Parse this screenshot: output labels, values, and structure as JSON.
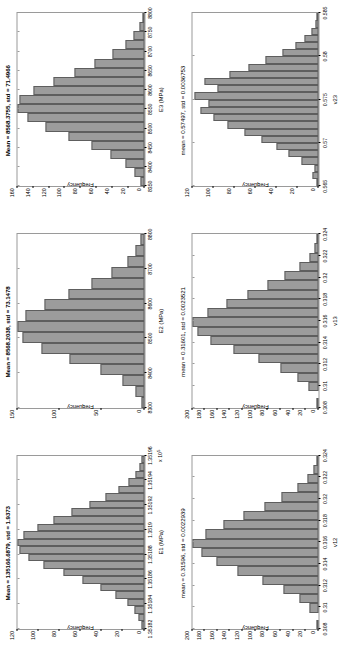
{
  "figure": {
    "bar_fill": "#9c9c9c",
    "bar_edge": "#5e5e5e",
    "axes_color": "#9a9a9a",
    "background": "#ffffff",
    "ylabel": "Frequency"
  },
  "chart_data": [
    {
      "type": "bar",
      "id": "E1",
      "title": "Mean = 135166.6879, std = 1.9373",
      "xlabel": "E1 (MPa)",
      "ylabel": "Frequency",
      "exponent": "x 10",
      "exponent_sup": "5",
      "xticklabels": [
        "1.35182",
        "1.35184",
        "1.35186",
        "1.35188",
        "1.3519",
        "1.35192",
        "1.35194",
        "1.35196"
      ],
      "yticklabels": [
        "0",
        "20",
        "40",
        "60",
        "80",
        "100",
        "120"
      ],
      "ylim": [
        0,
        120
      ],
      "grid": false,
      "legend": "none",
      "values": [
        2,
        5,
        9,
        16,
        27,
        41,
        58,
        76,
        95,
        110,
        118,
        120,
        114,
        101,
        86,
        69,
        52,
        37,
        24,
        15,
        8,
        4,
        2
      ]
    },
    {
      "type": "bar",
      "id": "E2",
      "title": "Mean = 8568.2038, std = 73.1478",
      "xlabel": "E2 (MPa)",
      "ylabel": "Frequency",
      "exponent": "",
      "exponent_sup": "",
      "xticklabels": [
        "8300",
        "8400",
        "8500",
        "8600",
        "8700",
        "8800"
      ],
      "yticklabels": [
        "0",
        "50",
        "100",
        "150"
      ],
      "ylim": [
        0,
        150
      ],
      "grid": false,
      "legend": "none",
      "values": [
        3,
        10,
        26,
        52,
        88,
        122,
        144,
        150,
        140,
        118,
        90,
        62,
        38,
        20,
        10,
        4
      ]
    },
    {
      "type": "bar",
      "id": "E3",
      "title": "Mean = 8568.3755, std = 71.4966",
      "xlabel": "E3 (MPa)",
      "ylabel": "Frequency",
      "exponent": "",
      "exponent_sup": "",
      "xticklabels": [
        "8350",
        "8400",
        "8450",
        "8500",
        "8550",
        "8600",
        "8650",
        "8700",
        "8750",
        "8800"
      ],
      "yticklabels": [
        "0",
        "20",
        "40",
        "60",
        "80",
        "100",
        "120",
        "140",
        "160"
      ],
      "ylim": [
        0,
        160
      ],
      "grid": false,
      "legend": "none",
      "values": [
        4,
        12,
        24,
        42,
        66,
        95,
        124,
        148,
        160,
        157,
        140,
        115,
        88,
        62,
        40,
        24,
        13,
        6,
        2
      ]
    },
    {
      "type": "bar",
      "id": "v12",
      "title": "mean = 0.31596, std = 0.0022939",
      "xlabel": "v12",
      "ylabel": "Frequency",
      "exponent": "",
      "exponent_sup": "",
      "xticklabels": [
        "0.308",
        "0.31",
        "0.312",
        "0.314",
        "0.316",
        "0.318",
        "0.32",
        "0.322",
        "0.324"
      ],
      "yticklabels": [
        "0",
        "20",
        "40",
        "60",
        "80",
        "100",
        "120",
        "140",
        "160",
        "180",
        "200"
      ],
      "ylim": [
        0,
        200
      ],
      "grid": false,
      "legend": "none",
      "values": [
        3,
        0,
        14,
        30,
        55,
        88,
        128,
        162,
        185,
        200,
        178,
        150,
        118,
        86,
        58,
        34,
        18,
        8,
        3
      ]
    },
    {
      "type": "bar",
      "id": "v13",
      "title": "mean = 0.31601, std = 0.0023521",
      "xlabel": "v13",
      "ylabel": "Frequency",
      "exponent": "",
      "exponent_sup": "",
      "xticklabels": [
        "0.308",
        "0.31",
        "0.312",
        "0.314",
        "0.316",
        "0.318",
        "0.32",
        "0.322",
        "0.324"
      ],
      "yticklabels": [
        "0",
        "20",
        "40",
        "60",
        "80",
        "100",
        "120",
        "140",
        "160",
        "180",
        "200"
      ],
      "ylim": [
        0,
        200
      ],
      "grid": false,
      "legend": "none",
      "values": [
        3,
        0,
        16,
        34,
        60,
        95,
        135,
        170,
        192,
        200,
        175,
        145,
        112,
        80,
        54,
        30,
        15,
        6,
        2
      ]
    },
    {
      "type": "bar",
      "id": "v23",
      "title": "mean = 0.57497, std = 0.0036753",
      "xlabel": "v23",
      "ylabel": "Frequency",
      "exponent": "",
      "exponent_sup": "",
      "xticklabels": [
        "0.565",
        "0.57",
        "0.575",
        "0.58",
        "0.585"
      ],
      "yticklabels": [
        "0",
        "20",
        "40",
        "60",
        "80",
        "100",
        "120"
      ],
      "ylim": [
        0,
        120
      ],
      "grid": false,
      "legend": "none",
      "values": [
        2,
        6,
        4,
        16,
        28,
        40,
        54,
        70,
        86,
        100,
        112,
        104,
        118,
        96,
        108,
        84,
        66,
        50,
        34,
        22,
        13,
        7,
        3,
        1
      ]
    }
  ]
}
